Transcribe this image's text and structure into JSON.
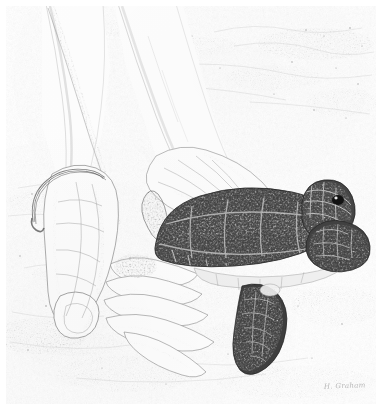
{
  "artwork": {
    "medium_style": "pen-and-ink stipple / graphite drawing",
    "subject": "Two human hands releasing a juvenile sea turtle onto sand",
    "palette": {
      "paper": "#ffffff",
      "light_tone": "#dcdcdc",
      "mid_tone": "#8d8d8d",
      "dark_tone": "#3a3a3a",
      "deepest_tone": "#1d1d1d"
    },
    "signature": "H. Graham",
    "title": "",
    "elements": {
      "background_label": "sand beach texture",
      "left_arm_label": "left forearm",
      "right_arm_label": "right forearm",
      "left_hand_label": "left hand, thumb down on sand",
      "right_hand_label": "right hand cradling turtle",
      "bracelet_label": "thin wrist bracelet",
      "turtle_label": "juvenile green sea turtle",
      "carapace_label": "turtle carapace with scutes",
      "head_label": "turtle head",
      "eye_label": "turtle eye",
      "front_flipper_label": "front flipper",
      "rear_flipper_label": "rear flipper",
      "plastron_label": "turtle underside edge"
    }
  }
}
